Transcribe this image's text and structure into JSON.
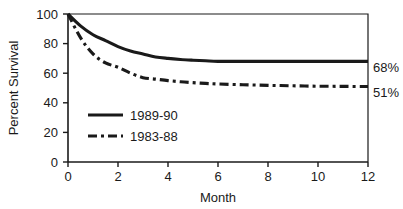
{
  "chart_data": {
    "type": "line",
    "title": "",
    "xlabel": "Month",
    "ylabel": "Percent Survival",
    "xlim": [
      0,
      12
    ],
    "ylim": [
      0,
      100
    ],
    "xticks": [
      "0",
      "2",
      "4",
      "6",
      "8",
      "10",
      "12"
    ],
    "yticks": [
      "0",
      "20",
      "40",
      "60",
      "80",
      "100"
    ],
    "grid": false,
    "legend_position": "inside-lower-left",
    "x": [
      0,
      0.5,
      1,
      1.5,
      2,
      2.5,
      3,
      3.5,
      4,
      4.5,
      5,
      5.5,
      6,
      7,
      8,
      9,
      10,
      11,
      12
    ],
    "series": [
      {
        "name": "1989-90",
        "style": "solid",
        "end_value": 68,
        "end_label": "68%",
        "values": [
          100,
          92,
          86,
          82,
          78,
          75,
          73,
          71,
          70,
          69.3,
          68.8,
          68.4,
          68,
          68,
          68,
          68,
          68,
          68,
          68
        ]
      },
      {
        "name": "1983-88",
        "style": "dashed",
        "end_value": 51,
        "end_label": "51%",
        "values": [
          100,
          84,
          73,
          67,
          64,
          60,
          57,
          56,
          55,
          54.2,
          53.6,
          53.1,
          52.7,
          52.2,
          51.8,
          51.5,
          51.2,
          51.1,
          51
        ]
      }
    ],
    "annotations": [
      {
        "text": "68%",
        "series": "1989-90",
        "at_x": 12,
        "at_y": 68
      },
      {
        "text": "51%",
        "series": "1983-88",
        "at_x": 12,
        "at_y": 51
      }
    ],
    "legend": [
      {
        "label": "1989-90",
        "style": "solid"
      },
      {
        "label": "1983-88",
        "style": "dashed"
      }
    ]
  }
}
